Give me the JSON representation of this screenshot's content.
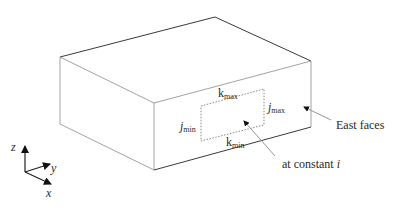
{
  "figure": {
    "box": {
      "corners": {
        "back_left_top": [
          60,
          57
        ],
        "back_top": [
          215,
          17
        ],
        "right_top": [
          311,
          61
        ],
        "front_top": [
          154,
          103
        ],
        "front_bottom": [
          154,
          170
        ],
        "right_bottom": [
          311,
          127
        ],
        "left_bottom": [
          60,
          124
        ]
      }
    },
    "region": {
      "corners": [
        [
          201,
          106
        ],
        [
          264,
          89
        ],
        [
          264,
          125
        ],
        [
          201,
          141
        ]
      ],
      "labels": {
        "k_max": {
          "base": "k",
          "sub": "max"
        },
        "k_min": {
          "base": "k",
          "sub": "min"
        },
        "j_min": {
          "base": "j",
          "sub": "min"
        },
        "j_max": {
          "base": "j",
          "sub": "max"
        }
      }
    },
    "callouts": {
      "east_faces": "East faces",
      "at_constant_prefix": "at constant ",
      "at_constant_var": "i"
    },
    "axes": {
      "z": "z",
      "y": "y",
      "x": "x"
    }
  }
}
